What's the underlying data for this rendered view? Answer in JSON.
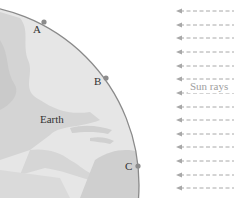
{
  "diagram": {
    "earth_label": "Earth",
    "rays_label": "Sun rays",
    "points": [
      {
        "label": "A",
        "x": 44,
        "y": 22
      },
      {
        "label": "B",
        "x": 106,
        "y": 78
      },
      {
        "label": "C",
        "x": 138,
        "y": 166
      }
    ],
    "ray_count": 14,
    "colors": {
      "earth_fill": "#e4e4e4",
      "land_fill": "#d2d2d2",
      "outline": "#8a8a8a",
      "point": "#8c8c8c",
      "ray": "#a8a8a8",
      "rays_text": "#a0a0a0"
    }
  }
}
